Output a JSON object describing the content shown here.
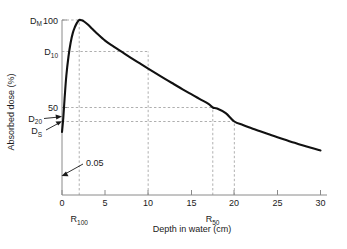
{
  "chart_data": {
    "type": "line",
    "title": "",
    "xlabel": "Depth in water (cm)",
    "ylabel": "Absorbed dose (%)",
    "xlim": [
      0,
      30
    ],
    "ylim": [
      0,
      100
    ],
    "grid": "dashed-guide-lines",
    "legend": "none",
    "xticks": [
      "0",
      "5",
      "10",
      "15",
      "20",
      "25",
      "30"
    ],
    "xtick_values": [
      0,
      5,
      10,
      15,
      20,
      25,
      30
    ],
    "yticks": [
      "50",
      "100"
    ],
    "ytick_values": [
      50,
      100
    ],
    "series": [
      {
        "name": "Depth dose curve",
        "x": [
          0.0,
          0.15,
          0.3,
          0.5,
          0.75,
          1.0,
          1.25,
          1.5,
          1.75,
          2.0,
          2.3,
          2.6,
          3.0,
          3.5,
          4.0,
          5.0,
          6.0,
          7.0,
          8.0,
          9.0,
          10.0,
          11.0,
          12.0,
          13.0,
          14.0,
          15.0,
          16.0,
          17.0,
          17.5,
          18.0,
          19.0,
          20.0,
          21.0,
          22.0,
          23.0,
          24.0,
          25.0,
          26.0,
          27.0,
          28.0,
          29.0,
          30.0
        ],
        "y": [
          36.0,
          44.0,
          55.0,
          68.0,
          79.0,
          87.0,
          92.5,
          96.0,
          98.5,
          100.0,
          99.8,
          99.0,
          97.4,
          95.0,
          92.6,
          88.2,
          84.8,
          81.6,
          78.4,
          75.3,
          72.2,
          69.2,
          66.2,
          63.3,
          60.4,
          57.6,
          54.8,
          52.1,
          50.0,
          49.4,
          46.8,
          42.0,
          40.0,
          38.2,
          36.4,
          34.7,
          33.0,
          31.4,
          29.8,
          28.3,
          26.8,
          25.4
        ]
      }
    ],
    "annotations": [
      {
        "name": "surface-dose-value",
        "label": "0.05",
        "points_to_x": 0.2,
        "points_to_y": 18
      },
      {
        "name": "max-dose-marker",
        "label": "D",
        "sub": "M",
        "value": 100,
        "axis": "y"
      },
      {
        "name": "dose-at-10cm-marker",
        "label": "D",
        "sub": "10",
        "value": 82,
        "axis": "y"
      },
      {
        "name": "dose-at-20cm-marker",
        "label": "D",
        "sub": "20",
        "value": 42,
        "axis": "y"
      },
      {
        "name": "surface-dose-marker",
        "label": "D",
        "sub": "S",
        "value": 36,
        "axis": "y"
      },
      {
        "name": "range-100-marker",
        "label": "R",
        "sub": "100",
        "value": 2,
        "axis": "x"
      },
      {
        "name": "range-50-marker",
        "label": "R",
        "sub": "50",
        "value": 17.5,
        "axis": "x"
      }
    ],
    "guide_lines": [
      {
        "name": "guide-dm-horizontal",
        "orientation": "horizontal",
        "y": 100,
        "x_from": 0,
        "x_to": 2
      },
      {
        "name": "guide-d10-horizontal",
        "orientation": "horizontal",
        "y": 82,
        "x_from": 0,
        "x_to": 10
      },
      {
        "name": "guide-50-horizontal",
        "orientation": "horizontal",
        "y": 50,
        "x_from": 0,
        "x_to": 17.5
      },
      {
        "name": "guide-d20-horizontal",
        "orientation": "horizontal",
        "y": 42,
        "x_from": 0,
        "x_to": 20
      },
      {
        "name": "guide-r100-vertical",
        "orientation": "vertical",
        "x": 2,
        "y_from": 0,
        "y_to": 100
      },
      {
        "name": "guide-x10-vertical",
        "orientation": "vertical",
        "x": 10,
        "y_from": 0,
        "y_to": 82
      },
      {
        "name": "guide-r50-vertical",
        "orientation": "vertical",
        "x": 17.5,
        "y_from": 0,
        "y_to": 50
      },
      {
        "name": "guide-x20-vertical",
        "orientation": "vertical",
        "x": 20,
        "y_from": 0,
        "y_to": 42
      }
    ],
    "colors": {
      "curve": "#111111",
      "grid": "#9a9a9a",
      "axis": "#8a8a8a",
      "text": "#1a1a1a",
      "background": "#ffffff"
    }
  },
  "labels": {
    "x_axis_title": "Depth in water (cm)",
    "y_axis_title": "Absorbed dose (%)",
    "y_100": "100",
    "y_50": "50",
    "x_0": "0",
    "x_5": "5",
    "x_10": "10",
    "x_15": "15",
    "x_20": "20",
    "x_25": "25",
    "x_30": "30",
    "d_m": "D",
    "d_m_sub": "M",
    "d_10": "D",
    "d_10_sub": "10",
    "d_20": "D",
    "d_20_sub": "20",
    "d_s": "D",
    "d_s_sub": "S",
    "r_100": "R",
    "r_100_sub": "100",
    "r_50": "R",
    "r_50_sub": "50",
    "annot_005": "0.05"
  }
}
